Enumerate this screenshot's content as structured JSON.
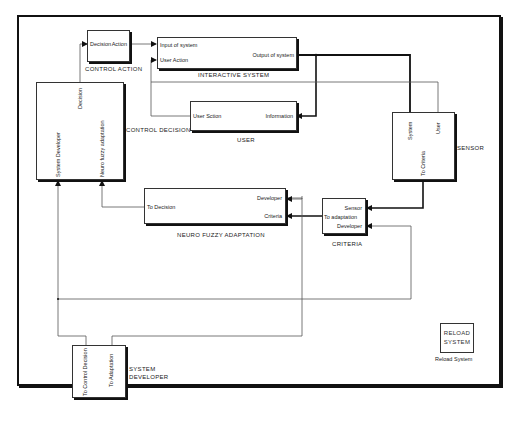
{
  "diagram": {
    "blocks": {
      "control_action": {
        "label": "CONTROL ACTION",
        "ports": {
          "in": "Decision",
          "out": "Action"
        }
      },
      "interactive_system": {
        "label": "INTERACTIVE SYSTEM",
        "ports": {
          "in1": "Input of system",
          "in2": "User Action",
          "out": "Output of system"
        }
      },
      "user": {
        "label": "USER",
        "ports": {
          "in": "Information",
          "out": "User Sction"
        }
      },
      "control_decision": {
        "label": "CONTROL DECISION",
        "ports": {
          "out": "Decision",
          "in1": "System Developer",
          "in2": "Neuro fuzzy adaptation"
        }
      },
      "sensor": {
        "label": "SENSOR",
        "ports": {
          "in1": "System",
          "in2": "User",
          "out": "To Criteria"
        }
      },
      "neuro_fuzzy_adaptation": {
        "label": "NEURO FUZZY ADAPTATION",
        "ports": {
          "out": "To Decision",
          "in1": "Developer",
          "in2": "Criteria"
        }
      },
      "criteria": {
        "label": "CRITERIA",
        "ports": {
          "in1": "Sensor",
          "in2": "Developer",
          "out": "To adaptation"
        }
      },
      "system_developer": {
        "label_line1": "SYSTEM",
        "label_line2": "DEVELOPER",
        "ports": {
          "out1": "To Control Decision",
          "out2": "To Adaptation"
        }
      },
      "reload_system": {
        "inner_line1": "RELOAD",
        "inner_line2": "SYSTEM",
        "label": "Reload System"
      }
    },
    "colors": {
      "line": "#111111",
      "thin_line": "#555555",
      "background": "#ffffff"
    }
  }
}
